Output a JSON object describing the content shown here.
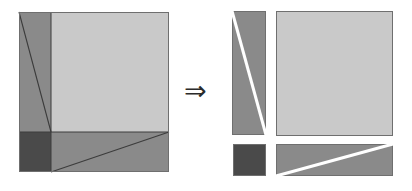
{
  "figure": {
    "kind": "block-matrix-decomposition-diagram",
    "background": "#ffffff",
    "width": 412,
    "height": 191,
    "operator": {
      "glyph": "⇒",
      "name": "implies-arrow",
      "x": 184,
      "y": 77,
      "color": "#2b2b2b"
    },
    "palette": {
      "light_gray": "#c9c9c9",
      "medium_gray": "#8a8a8a",
      "dark_gray": "#4a4a4a",
      "border": "#6f6f6f",
      "rule": "#3c3c3c",
      "gap": "#ffffff"
    },
    "left_panel": {
      "label": "combined-matrix",
      "x": 19,
      "y": 12,
      "width": 150,
      "height": 160,
      "split_x": 32,
      "split_y": 120,
      "blocks": [
        {
          "name": "left-column-strip",
          "fill": "#8a8a8a",
          "x": 0,
          "y": 0,
          "width": 32,
          "height": 120
        },
        {
          "name": "main-light-block",
          "fill": "#c9c9c9",
          "x": 32,
          "y": 0,
          "width": 118,
          "height": 120
        },
        {
          "name": "bottom-left-dark-block",
          "fill": "#4a4a4a",
          "x": 0,
          "y": 120,
          "width": 32,
          "height": 40
        },
        {
          "name": "bottom-right-strip",
          "fill": "#8a8a8a",
          "x": 32,
          "y": 120,
          "width": 118,
          "height": 40
        }
      ],
      "diagonals": [
        {
          "name": "column-strip-diagonal",
          "x1": 0,
          "y1": 0,
          "x2": 32,
          "y2": 120
        },
        {
          "name": "bottom-strip-diagonal",
          "x1": 32,
          "y1": 160,
          "x2": 150,
          "y2": 120
        }
      ]
    },
    "right_panel": {
      "label": "separated-blocks",
      "blocks": [
        {
          "name": "tall-strip-block",
          "fill": "#8a8a8a",
          "x": 232,
          "y": 11,
          "width": 34,
          "height": 124,
          "cut": {
            "name": "white-diagonal-cut",
            "x1": 0,
            "y1": 0,
            "x2": 34,
            "y2": 124
          }
        },
        {
          "name": "large-light-block",
          "fill": "#c9c9c9",
          "x": 276,
          "y": 11,
          "width": 117,
          "height": 125,
          "cut": null
        },
        {
          "name": "small-dark-block",
          "fill": "#4a4a4a",
          "x": 233,
          "y": 144,
          "width": 33,
          "height": 32,
          "cut": null
        },
        {
          "name": "wide-bottom-block",
          "fill": "#8a8a8a",
          "x": 276,
          "y": 144,
          "width": 117,
          "height": 32,
          "cut": {
            "name": "white-diagonal-cut",
            "x1": 0,
            "y1": 32,
            "x2": 117,
            "y2": 0
          }
        }
      ]
    }
  }
}
